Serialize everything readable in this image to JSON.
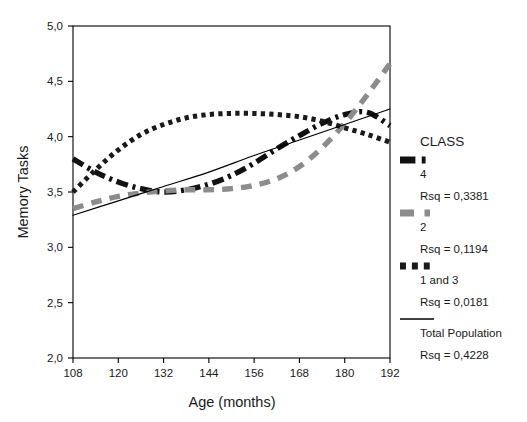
{
  "chart_data": {
    "type": "line",
    "title": "",
    "xlabel": "Age (months)",
    "ylabel": "Memory Tasks",
    "xlim": [
      108,
      192
    ],
    "ylim": [
      2.0,
      5.0
    ],
    "xticks": [
      108,
      120,
      132,
      144,
      156,
      168,
      180,
      192
    ],
    "xtick_labels": [
      "108",
      "120",
      "132",
      "144",
      "156",
      "168",
      "180",
      "192"
    ],
    "yticks": [
      2.0,
      2.5,
      3.0,
      3.5,
      4.0,
      4.5,
      5.0
    ],
    "ytick_labels": [
      "2,0",
      "2,5",
      "3,0",
      "3,5",
      "4,0",
      "4,5",
      "5,0"
    ],
    "grid": false,
    "legend_position": "right",
    "series": [
      {
        "name": "4",
        "legend_label": "4",
        "rsq_label": "Rsq = 0,3381",
        "rsq": 0.3381,
        "style": "dash-dot",
        "color": "#111111",
        "width": 5.4,
        "x": [
          108,
          114,
          120,
          126,
          132,
          138,
          144,
          150,
          156,
          162,
          168,
          174,
          180,
          186,
          192
        ],
        "y": [
          3.8,
          3.68,
          3.59,
          3.53,
          3.5,
          3.52,
          3.57,
          3.65,
          3.76,
          3.89,
          4.01,
          4.12,
          4.2,
          4.22,
          4.1
        ]
      },
      {
        "name": "2",
        "legend_label": "2",
        "rsq_label": "Rsq = 0,1194",
        "rsq": 0.1194,
        "style": "dashed",
        "color": "#8c8c8c",
        "width": 5.4,
        "x": [
          108,
          114,
          120,
          126,
          132,
          138,
          144,
          150,
          156,
          162,
          168,
          174,
          180,
          186,
          192
        ],
        "y": [
          3.35,
          3.41,
          3.46,
          3.49,
          3.51,
          3.52,
          3.52,
          3.53,
          3.56,
          3.62,
          3.73,
          3.9,
          4.12,
          4.38,
          4.66
        ]
      },
      {
        "name": "1 and 3",
        "legend_label": "1 and 3",
        "rsq_label": "Rsq = 0,0181",
        "rsq": 0.0181,
        "style": "dotted",
        "color": "#1a1a1a",
        "width": 5.0,
        "x": [
          108,
          114,
          120,
          126,
          132,
          138,
          144,
          150,
          156,
          162,
          168,
          174,
          180,
          186,
          192
        ],
        "y": [
          3.5,
          3.7,
          3.88,
          4.02,
          4.11,
          4.17,
          4.2,
          4.21,
          4.21,
          4.2,
          4.18,
          4.14,
          4.08,
          4.02,
          3.95
        ]
      },
      {
        "name": "Total Population",
        "legend_label": "Total Population",
        "rsq_label": "Rsq = 0,4228",
        "rsq": 0.4228,
        "style": "solid",
        "color": "#000000",
        "width": 1.2,
        "x": [
          108,
          120,
          132,
          144,
          156,
          168,
          180,
          192
        ],
        "y": [
          3.29,
          3.42,
          3.55,
          3.68,
          3.83,
          3.97,
          4.11,
          4.25
        ]
      }
    ]
  },
  "legend": {
    "title": "CLASS",
    "entries": [
      {
        "label": "4",
        "rsq": "Rsq = 0,3381",
        "swatch": "dash-dot-black"
      },
      {
        "label": "2",
        "rsq": "Rsq = 0,1194",
        "swatch": "dashed-gray"
      },
      {
        "label": "1 and 3",
        "rsq": "Rsq = 0,0181",
        "swatch": "dotted-black"
      },
      {
        "label": "Total Population",
        "rsq": "Rsq = 0,4228",
        "swatch": "solid-thin"
      }
    ]
  },
  "colors": {
    "class4": "#111111",
    "class2": "#8c8c8c",
    "class13": "#1a1a1a",
    "total": "#000000",
    "axis": "#000000",
    "background": "#ffffff"
  }
}
